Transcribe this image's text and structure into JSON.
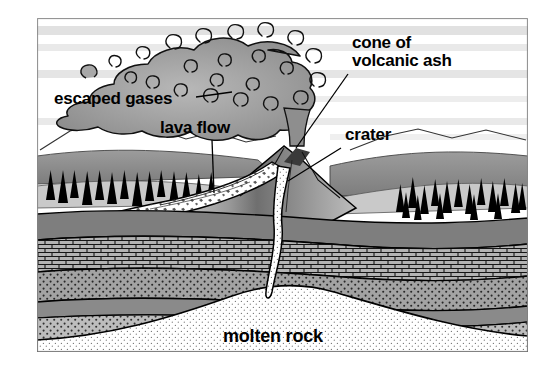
{
  "figure": {
    "kind": "diagram",
    "title_visible": false,
    "background_color": "#ffffff",
    "ink_color": "#000000",
    "frame": {
      "x": 37,
      "y": 18,
      "width": 491,
      "height": 334
    }
  },
  "labels": [
    {
      "id": "cone-of-volcanic-ash",
      "text_line1": "cone of",
      "text_line2": "volcanic ash",
      "x": 352,
      "y": 34,
      "font_size": 17,
      "leader": {
        "from_x": 348,
        "from_y": 74,
        "to_x": 296,
        "to_y": 148
      }
    },
    {
      "id": "escaped-gases",
      "text_line1": "escaped gases",
      "text_line2": "",
      "x": 54,
      "y": 90,
      "font_size": 17,
      "leader": {
        "from_x": 196,
        "from_y": 97,
        "to_x": 232,
        "to_y": 92
      }
    },
    {
      "id": "lava-flow",
      "text_line1": "lava flow",
      "text_line2": "",
      "x": 160,
      "y": 119,
      "font_size": 17,
      "leader": {
        "from_x": 212,
        "from_y": 140,
        "to_x": 214,
        "to_y": 193
      }
    },
    {
      "id": "crater",
      "text_line1": "crater",
      "text_line2": "",
      "x": 345,
      "y": 126,
      "font_size": 17,
      "leader": {
        "from_x": 341,
        "from_y": 148,
        "to_x": 288,
        "to_y": 181
      }
    },
    {
      "id": "molten-rock",
      "text_line1": "molten rock",
      "text_line2": "",
      "x": 223,
      "y": 327,
      "font_size": 18,
      "leader": null
    }
  ],
  "scene": {
    "sky": {
      "fill": "#ffffff",
      "bands": [
        {
          "y": 26,
          "height": 9,
          "opacity": 0.3
        },
        {
          "y": 44,
          "height": 7,
          "opacity": 0.22
        },
        {
          "y": 70,
          "height": 8,
          "opacity": 0.26
        },
        {
          "y": 96,
          "height": 6,
          "opacity": 0.18
        },
        {
          "y": 118,
          "height": 7,
          "opacity": 0.22
        }
      ]
    },
    "ash_plume": {
      "name": "billowing ash cloud",
      "drift_direction": "left",
      "fill": "#9a9a9a",
      "outline": "#111111"
    },
    "mountains": {
      "name": "background mountain ridge",
      "fill": "#ffffff",
      "outline": "#222222"
    },
    "hills": {
      "name": "midground hills",
      "fill": "#8d8d8d"
    },
    "trees": {
      "name": "conifer trees",
      "fill": "#000000",
      "left_group_count": 14,
      "right_group_count": 17
    },
    "volcano": {
      "cone_fill": "#8a8a8a",
      "cone_outline": "#000000",
      "crater_notch": true,
      "lava_flow": {
        "name": "lava flow down left flank",
        "fill": "#ffffff",
        "texture": "rubbly blocks"
      }
    },
    "strata": [
      {
        "id": "topsoil",
        "label_hidden": "soil",
        "fill": "#7e7e7e",
        "pattern": "solid"
      },
      {
        "id": "brick-layer",
        "label_hidden": "bedrock",
        "fill": "#b3b3b3",
        "pattern": "brick"
      },
      {
        "id": "stipple-upper",
        "label_hidden": "sandstone",
        "fill": "#a3a3a3",
        "pattern": "stipple"
      },
      {
        "id": "solid-gray",
        "label_hidden": "shale",
        "fill": "#8a8a8a",
        "pattern": "solid"
      },
      {
        "id": "stipple-lower",
        "label_hidden": "sediment",
        "fill": "#bdbdbd",
        "pattern": "stipple"
      }
    ],
    "magma": {
      "chamber": {
        "name": "magma chamber dome",
        "fill": "#ffffff",
        "texture": "fine stipple"
      },
      "conduit": {
        "name": "volcanic vent conduit",
        "fill": "#ffffff"
      }
    }
  }
}
